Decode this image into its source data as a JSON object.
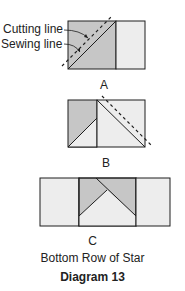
{
  "colors": {
    "dark_fill": "#c6c6c6",
    "light_fill": "#ededed",
    "stroke": "#1e1e1e"
  },
  "diagram_a": {
    "callouts": [
      "Cutting line",
      "Sewing line"
    ],
    "label": "A"
  },
  "diagram_b": {
    "label": "B"
  },
  "diagram_c": {
    "label": "C",
    "caption": "Bottom Row of Star"
  },
  "title": "Diagram 13"
}
